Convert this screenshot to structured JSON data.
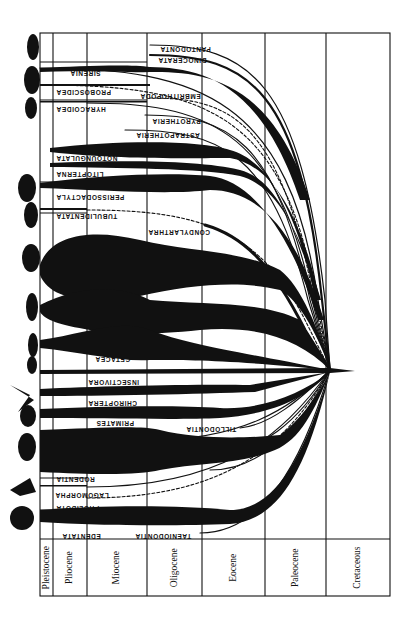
{
  "diagram": {
    "orientation": "rotated 180deg; time flows right-to-left",
    "ink_color": "#111111",
    "background": "#ffffff",
    "time_periods": [
      {
        "label": "Pleistocene",
        "x0": 40,
        "x1": 53
      },
      {
        "label": "Pliocene",
        "x0": 53,
        "x1": 87
      },
      {
        "label": "Miocene",
        "x0": 87,
        "x1": 147
      },
      {
        "label": "Oligocene",
        "x0": 147,
        "x1": 202
      },
      {
        "label": "Eocene",
        "x0": 202,
        "x1": 265
      },
      {
        "label": "Paleocene",
        "x0": 265,
        "x1": 326
      },
      {
        "label": "Cretaceous",
        "x0": 326,
        "x1": 390
      }
    ],
    "origin_point": {
      "x": 330,
      "y": 370
    },
    "lineages": [
      {
        "label": "PANTODONTA",
        "y": 45,
        "type": "thin",
        "extant": false
      },
      {
        "label": "DINOCERATA",
        "y": 55,
        "type": "thin",
        "extant": false
      },
      {
        "label": "SIRENIA",
        "y": 68,
        "type": "thick",
        "extant": true
      },
      {
        "label": "PROBOSCIDEA",
        "y": 85,
        "type": "thick",
        "extant": true
      },
      {
        "label": "EMBRITHOPODA",
        "y": 98,
        "type": "dashed",
        "extant": false
      },
      {
        "label": "HYRACOIDEA",
        "y": 103,
        "type": "thin",
        "extant": true
      },
      {
        "label": "PYROTHERIA",
        "y": 115,
        "type": "thin",
        "extant": false
      },
      {
        "label": "ASTRAPOTHERIA",
        "y": 130,
        "type": "thin",
        "extant": false
      },
      {
        "label": "NOTOUNGULATA",
        "y": 155,
        "type": "thick",
        "extant": false
      },
      {
        "label": "LITOPTERNA",
        "y": 165,
        "type": "medium",
        "extant": false
      },
      {
        "label": "PERISSODACTYLA",
        "y": 183,
        "type": "thick",
        "extant": true
      },
      {
        "label": "TUBULIDENTATA",
        "y": 210,
        "type": "dashed",
        "extant": true
      },
      {
        "label": "CONDYLARTHRA",
        "y": 230,
        "type": "medium",
        "extant": false
      },
      {
        "label": "ARTIODACTYLA",
        "y": 255,
        "type": "thick",
        "extant": true
      },
      {
        "label": "CARNIVORA",
        "y": 310,
        "type": "thick",
        "extant": true
      },
      {
        "label": "CETACEA",
        "y": 345,
        "type": "thick",
        "extant": true
      },
      {
        "label": "INSECTIVORA",
        "y": 372,
        "type": "thick",
        "extant": true
      },
      {
        "label": "CHIROPTERA",
        "y": 393,
        "type": "thick",
        "extant": true
      },
      {
        "label": "PRIMATES",
        "y": 415,
        "type": "thick",
        "extant": true
      },
      {
        "label": "TILLODONTIA",
        "y": 428,
        "type": "thin",
        "extant": false
      },
      {
        "label": "RODENTIA",
        "y": 450,
        "type": "thick",
        "extant": true
      },
      {
        "label": "LAGOMORPHA",
        "y": 487,
        "type": "thin",
        "extant": true
      },
      {
        "label": "PHOLIDOTA",
        "y": 498,
        "type": "dashed",
        "extant": true
      },
      {
        "label": "EDENTATA",
        "y": 520,
        "type": "thick",
        "extant": true
      },
      {
        "label": "TAENIODONTIA",
        "y": 533,
        "type": "thin",
        "extant": false
      }
    ]
  }
}
